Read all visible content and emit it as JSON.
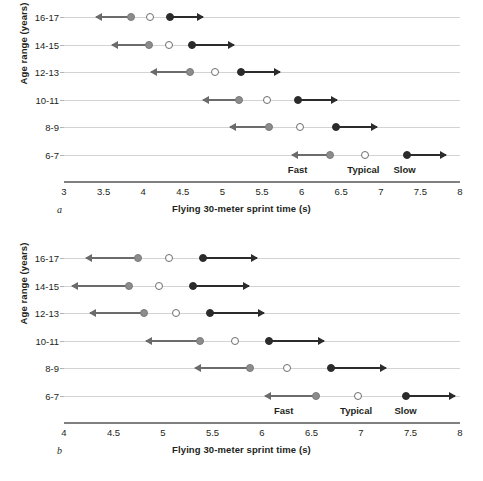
{
  "figure": {
    "background": "#ffffff",
    "colors": {
      "fast_marker": "#8c8c8c",
      "typical_marker": "#ffffff",
      "slow_marker": "#2b2b2b",
      "left_arrow": "#6b6b6b",
      "right_arrow": "#2b2b2b",
      "row_line": "#d3d3d3",
      "axis_line": "#808080",
      "text": "#231f20"
    }
  },
  "chart_data": [
    {
      "type": "scatter",
      "panel": "a",
      "panel_letter": "a",
      "title": "",
      "xlabel": "Flying 30-meter sprint time (s)",
      "ylabel": "Age range (years)",
      "xlim": [
        3,
        8
      ],
      "xticks": [
        "3",
        "3.5",
        "4",
        "4.5",
        "5",
        "5.5",
        "6",
        "6.5",
        "7",
        "7.5",
        "8"
      ],
      "xtick_values": [
        3,
        3.5,
        4,
        4.5,
        5,
        5.5,
        6,
        6.5,
        7,
        7.5,
        8
      ],
      "categories": [
        "16-17",
        "14-15",
        "12-13",
        "10-11",
        "8-9",
        "6-7"
      ],
      "grid": false,
      "legend": "inline zone labels",
      "zone_labels": [
        {
          "label": "Fast",
          "x": 5.95
        },
        {
          "label": "Typical",
          "x": 6.78
        },
        {
          "label": "Slow",
          "x": 7.3
        }
      ],
      "series": [
        {
          "name": "Fast",
          "marker": "gray-filled-circle",
          "values": [
            3.85,
            4.07,
            4.59,
            5.21,
            5.59,
            6.36
          ]
        },
        {
          "name": "Typical",
          "marker": "open-circle",
          "values": [
            4.09,
            4.33,
            4.91,
            5.56,
            5.98,
            6.8
          ]
        },
        {
          "name": "Slow",
          "marker": "black-filled-circle",
          "values": [
            4.34,
            4.61,
            5.23,
            5.95,
            6.43,
            7.33
          ]
        }
      ],
      "arrows": [
        {
          "category": "16-17",
          "left_from": 3.85,
          "left_to": 3.4,
          "right_from": 4.34,
          "right_to": 4.75
        },
        {
          "category": "14-15",
          "left_from": 4.07,
          "left_to": 3.6,
          "right_from": 4.61,
          "right_to": 5.15
        },
        {
          "category": "12-13",
          "left_from": 4.59,
          "left_to": 4.1,
          "right_from": 5.23,
          "right_to": 5.73
        },
        {
          "category": "10-11",
          "left_from": 5.21,
          "left_to": 4.75,
          "right_from": 5.95,
          "right_to": 6.45
        },
        {
          "category": "8-9",
          "left_from": 5.59,
          "left_to": 5.1,
          "right_from": 6.43,
          "right_to": 6.95
        },
        {
          "category": "6-7",
          "left_from": 6.36,
          "left_to": 5.88,
          "right_from": 7.33,
          "right_to": 7.82
        }
      ]
    },
    {
      "type": "scatter",
      "panel": "b",
      "panel_letter": "b",
      "title": "",
      "xlabel": "Flying 30-meter sprint time (s)",
      "ylabel": "Age range (years)",
      "xlim": [
        4,
        8
      ],
      "xticks": [
        "4",
        "4.5",
        "5",
        "5.5",
        "6",
        "6.5",
        "7",
        "7.5",
        "8"
      ],
      "xtick_values": [
        4,
        4.5,
        5,
        5.5,
        6,
        6.5,
        7,
        7.5,
        8
      ],
      "categories": [
        "16-17",
        "14-15",
        "12-13",
        "10-11",
        "8-9",
        "6-7"
      ],
      "grid": false,
      "legend": "inline zone labels",
      "zone_labels": [
        {
          "label": "Fast",
          "x": 6.22
        },
        {
          "label": "Typical",
          "x": 6.95
        },
        {
          "label": "Slow",
          "x": 7.45
        }
      ],
      "series": [
        {
          "name": "Fast",
          "marker": "gray-filled-circle",
          "values": [
            4.75,
            4.66,
            4.81,
            5.37,
            5.88,
            6.55
          ]
        },
        {
          "name": "Typical",
          "marker": "open-circle",
          "values": [
            5.06,
            4.96,
            5.13,
            5.73,
            6.25,
            6.97
          ]
        },
        {
          "name": "Slow",
          "marker": "black-filled-circle",
          "values": [
            5.4,
            5.3,
            5.47,
            6.07,
            6.7,
            7.45
          ]
        }
      ],
      "arrows": [
        {
          "category": "16-17",
          "left_from": 4.75,
          "left_to": 4.22,
          "right_from": 5.4,
          "right_to": 5.95
        },
        {
          "category": "14-15",
          "left_from": 4.66,
          "left_to": 4.08,
          "right_from": 5.3,
          "right_to": 5.87
        },
        {
          "category": "12-13",
          "left_from": 4.81,
          "left_to": 4.26,
          "right_from": 5.47,
          "right_to": 6.02
        },
        {
          "category": "10-11",
          "left_from": 5.37,
          "left_to": 4.83,
          "right_from": 6.07,
          "right_to": 6.63
        },
        {
          "category": "8-9",
          "left_from": 5.88,
          "left_to": 5.32,
          "right_from": 6.7,
          "right_to": 7.25
        },
        {
          "category": "6-7",
          "left_from": 6.55,
          "left_to": 6.03,
          "right_from": 7.45,
          "right_to": 7.95
        }
      ]
    }
  ]
}
